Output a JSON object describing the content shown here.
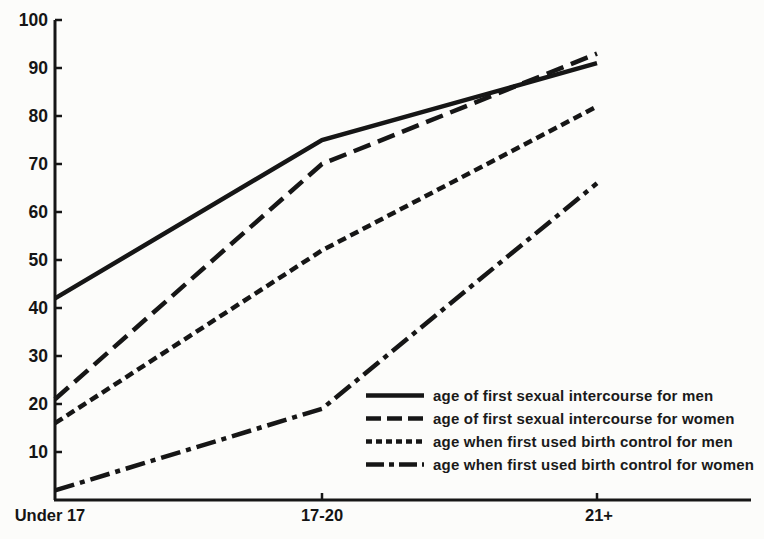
{
  "figure": {
    "background": "#fcfcfa",
    "ink": "#161616"
  },
  "chart_data": {
    "type": "line",
    "categories": [
      "Under 17",
      "17-20",
      "21+"
    ],
    "series": [
      {
        "name": "age of first sexual intercourse for men",
        "dash": "solid",
        "values": [
          42,
          75,
          91
        ]
      },
      {
        "name": "age of first sexual intercourse for women",
        "dash": "long-dash",
        "values": [
          21,
          70,
          93
        ]
      },
      {
        "name": "age when first used birth control for men",
        "dash": "short-dash",
        "values": [
          16,
          52,
          82
        ]
      },
      {
        "name": "age when first used birth control for women",
        "dash": "dash-dot",
        "values": [
          2,
          19,
          66
        ]
      }
    ],
    "title": "",
    "xlabel": "",
    "ylabel": "",
    "ylim": [
      0,
      100
    ],
    "yticks": [
      10,
      20,
      30,
      40,
      50,
      60,
      70,
      80,
      90,
      100
    ],
    "grid": false,
    "legend_position": "inside-lower-right"
  }
}
